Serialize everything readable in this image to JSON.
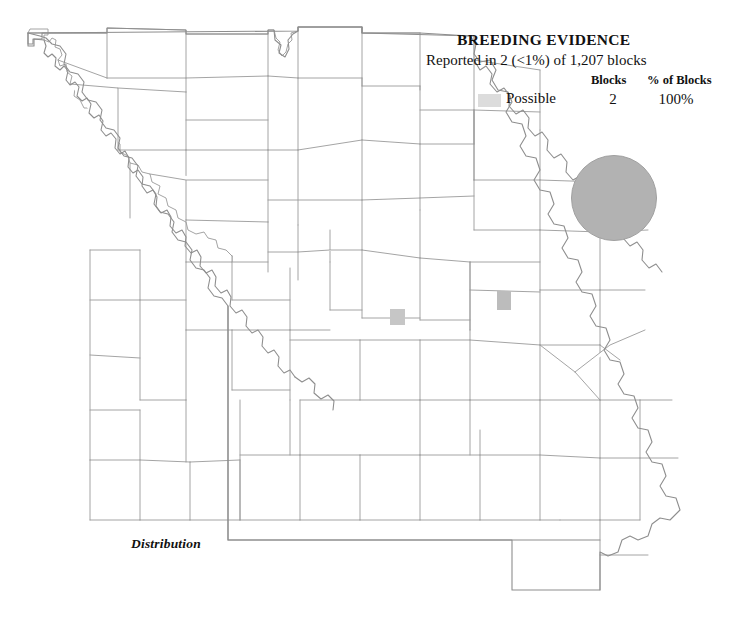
{
  "map": {
    "region_name": "Missouri",
    "caption": "Distribution",
    "line_color": "#9a9a9a",
    "background_color": "#ffffff",
    "blocks": [
      {
        "name": "possible-block-central",
        "x": 390,
        "y": 309,
        "w": 15,
        "h": 16,
        "color": "#c6c6c6"
      },
      {
        "name": "possible-block-east",
        "x": 497,
        "y": 291,
        "w": 14,
        "h": 19,
        "color": "#bcbcbc"
      }
    ]
  },
  "legend": {
    "title": "BREEDING EVIDENCE",
    "subtitle": "Reported in 2 (<1%) of 1,207 blocks",
    "columns": {
      "blocks": "Blocks",
      "percent": "% of Blocks"
    },
    "rows": [
      {
        "label": "Possible",
        "blocks": "2",
        "percent": "100%",
        "swatch_color": "#dcdcdc"
      }
    ]
  },
  "abundance": {
    "symbol": "filled-circle",
    "color": "#b2b2b2",
    "diameter_px": 86
  }
}
